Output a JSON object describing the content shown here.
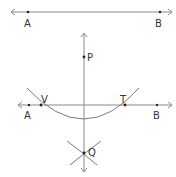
{
  "diagram": {
    "colors": {
      "line": "#8a8a8a",
      "arc": "#7a7a7a",
      "point": "#222222",
      "label": "#333333"
    },
    "top_line": {
      "points": [
        {
          "label": "A",
          "x": 28,
          "y": 12
        },
        {
          "label": "B",
          "x": 160,
          "y": 12
        }
      ]
    },
    "construction": {
      "points": [
        {
          "label": "P",
          "x": 84,
          "y": 57
        },
        {
          "label": "V",
          "x": 41,
          "y": 105
        },
        {
          "label": "T",
          "x": 125,
          "y": 105
        },
        {
          "label": "A",
          "x": 29,
          "y": 105
        },
        {
          "label": "B",
          "x": 157,
          "y": 105
        },
        {
          "label": "Q",
          "x": 84,
          "y": 153
        }
      ]
    }
  }
}
